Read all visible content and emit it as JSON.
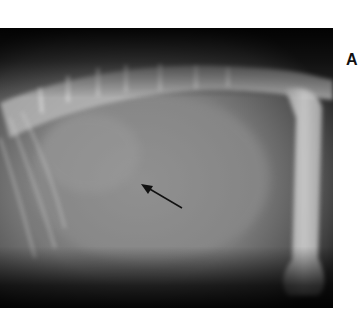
{
  "figure": {
    "panel_label": "A",
    "image_type": "lateral radiograph",
    "annotation": {
      "type": "arrow",
      "from": [
        182,
        208
      ],
      "to": [
        141,
        184
      ],
      "color": "#111111"
    }
  }
}
